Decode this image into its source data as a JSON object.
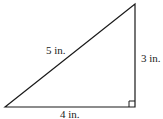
{
  "diagram": {
    "type": "right-triangle",
    "labels": {
      "hypotenuse": "5 in.",
      "vertical_leg": "3 in.",
      "horizontal_leg": "4 in."
    },
    "right_angle_marker": true,
    "colors": {
      "stroke": "#1a1a1a",
      "background": "#ffffff"
    }
  }
}
